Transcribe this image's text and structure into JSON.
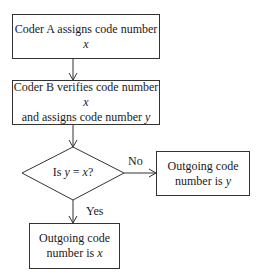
{
  "diagram": {
    "nodes": [
      {
        "id": "coder-a",
        "type": "process",
        "text": "Coder A assigns code number ",
        "var": "x"
      },
      {
        "id": "coder-b",
        "type": "process",
        "line1": "Coder B verifies code number ",
        "line1_var": "x",
        "line2": "and assigns code number ",
        "line2_var": "y"
      },
      {
        "id": "decision",
        "type": "decision",
        "pre": "Is ",
        "var1": "y",
        "mid": " = ",
        "var2": "x",
        "post": "?"
      },
      {
        "id": "out-y",
        "type": "process",
        "line1": "Outgoing code",
        "line2": "number is ",
        "var": "y"
      },
      {
        "id": "out-x",
        "type": "process",
        "line1": "Outgoing code",
        "line2": "number is ",
        "var": "x"
      }
    ],
    "edges": [
      {
        "from": "coder-a",
        "to": "coder-b",
        "label": ""
      },
      {
        "from": "coder-b",
        "to": "decision",
        "label": ""
      },
      {
        "from": "decision",
        "to": "out-y",
        "label": "No"
      },
      {
        "from": "decision",
        "to": "out-x",
        "label": "Yes"
      }
    ]
  }
}
